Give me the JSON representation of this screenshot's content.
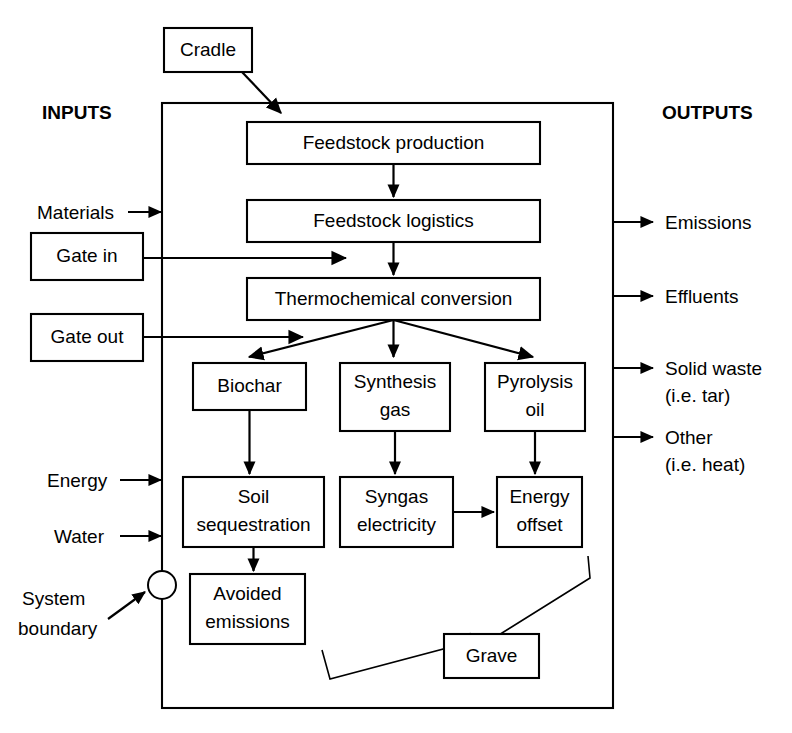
{
  "figure": {
    "headers": {
      "inputs": "INPUTS",
      "outputs": "OUTPUTS"
    },
    "colors": {
      "line": "#000000",
      "background": "#ffffff",
      "box_fill": "#ffffff"
    }
  },
  "nodes": {
    "cradle": {
      "label": "Cradle",
      "x": 164,
      "y": 28,
      "w": 88,
      "h": 44
    },
    "feedstock_production": {
      "label": "Feedstock production",
      "x": 247,
      "y": 122,
      "w": 293,
      "h": 42
    },
    "feedstock_logistics": {
      "label": "Feedstock logistics",
      "x": 247,
      "y": 200,
      "w": 293,
      "h": 42
    },
    "thermochemical_conversion": {
      "label": "Thermochemical conversion",
      "x": 247,
      "y": 278,
      "w": 293,
      "h": 42
    },
    "biochar": {
      "label": "Biochar",
      "x": 193,
      "y": 363,
      "w": 113,
      "h": 47
    },
    "synthesis_gas": {
      "label_line1": "Synthesis",
      "label_line2": "gas",
      "x": 340,
      "y": 363,
      "w": 110,
      "h": 68
    },
    "pyrolysis_oil": {
      "label_line1": "Pyrolysis",
      "label_line2": "oil",
      "x": 485,
      "y": 363,
      "w": 100,
      "h": 68
    },
    "soil_sequestration": {
      "label_line1": "Soil",
      "label_line2": "sequestration",
      "x": 183,
      "y": 477,
      "w": 141,
      "h": 70
    },
    "syngas_electricity": {
      "label_line1": "Syngas",
      "label_line2": "electricity",
      "x": 340,
      "y": 477,
      "w": 113,
      "h": 70
    },
    "energy_offset": {
      "label_line1": "Energy",
      "label_line2": "offset",
      "x": 497,
      "y": 477,
      "w": 85,
      "h": 70
    },
    "avoided_emissions": {
      "label_line1": "Avoided",
      "label_line2": "emissions",
      "x": 190,
      "y": 574,
      "w": 115,
      "h": 70
    },
    "gate_in": {
      "label": "Gate in",
      "x": 31,
      "y": 233,
      "w": 112,
      "h": 47
    },
    "gate_out": {
      "label": "Gate out",
      "x": 31,
      "y": 314,
      "w": 112,
      "h": 47
    },
    "grave": {
      "label": "Grave",
      "x": 444,
      "y": 634,
      "w": 95,
      "h": 44
    }
  },
  "system_boundary": {
    "x": 162,
    "y": 103,
    "w": 451,
    "h": 605
  },
  "inputs": [
    {
      "label": "Materials",
      "y": 212
    },
    {
      "label": "Energy",
      "y": 480
    },
    {
      "label": "Water",
      "y": 536
    }
  ],
  "outputs": [
    {
      "line1": "Emissions",
      "line2": "",
      "y": 222
    },
    {
      "line1": "Effluents",
      "line2": "",
      "y": 296
    },
    {
      "line1": "Solid waste",
      "line2": "(i.e. tar)",
      "y": 368
    },
    {
      "line1": "Other",
      "line2": "(i.e. heat)",
      "y": 437
    }
  ],
  "annotations": {
    "system_boundary": {
      "line1": "System",
      "line2": "boundary",
      "marker": "circle",
      "marker_x": 162,
      "marker_y": 585,
      "marker_r": 14
    }
  },
  "edges": [
    {
      "from": "cradle",
      "to": "feedstock_production",
      "type": "diagonal-arrow"
    },
    {
      "from": "feedstock_production",
      "to": "feedstock_logistics",
      "type": "down-arrow"
    },
    {
      "from": "feedstock_logistics",
      "to": "thermochemical_conversion",
      "type": "down-arrow"
    },
    {
      "from": "gate_in",
      "to": "thermochemical_conversion",
      "type": "right-arrow"
    },
    {
      "from": "gate_out",
      "to": "products-split",
      "type": "right-arrow"
    },
    {
      "from": "thermochemical_conversion",
      "to": "biochar",
      "type": "split-arrow"
    },
    {
      "from": "thermochemical_conversion",
      "to": "synthesis_gas",
      "type": "down-arrow"
    },
    {
      "from": "thermochemical_conversion",
      "to": "pyrolysis_oil",
      "type": "split-arrow"
    },
    {
      "from": "biochar",
      "to": "soil_sequestration",
      "type": "down-arrow"
    },
    {
      "from": "synthesis_gas",
      "to": "syngas_electricity",
      "type": "down-arrow"
    },
    {
      "from": "pyrolysis_oil",
      "to": "energy_offset",
      "type": "down-arrow"
    },
    {
      "from": "syngas_electricity",
      "to": "energy_offset",
      "type": "right-arrow"
    },
    {
      "from": "soil_sequestration",
      "to": "avoided_emissions",
      "type": "down-arrow"
    },
    {
      "from": "brace",
      "to": "grave",
      "type": "brace-pointer"
    }
  ]
}
